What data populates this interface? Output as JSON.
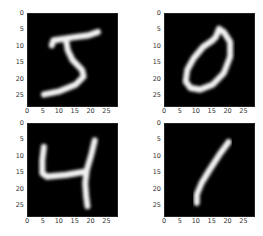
{
  "chart_data": [
    {
      "type": "heatmap",
      "title": "",
      "label": "5",
      "xlabel": "",
      "ylabel": "",
      "xlim": [
        0,
        28
      ],
      "ylim": [
        28,
        0
      ],
      "xticks": [
        "0",
        "5",
        "10",
        "15",
        "20",
        "25"
      ],
      "yticks": [
        "0",
        "5",
        "10",
        "15",
        "20",
        "25"
      ],
      "colormap": "gray",
      "grid": false,
      "stroke": "M22,5.5 L19,6.5 L15,7 L8,8 L7.5,9.5 M12,8 L12.5,11 L14,14 L17,17 L17.5,19 L15,21.5 L10,23.5 L5,24.5"
    },
    {
      "type": "heatmap",
      "title": "",
      "label": "0",
      "xlabel": "",
      "ylabel": "",
      "xlim": [
        0,
        28
      ],
      "ylim": [
        28,
        0
      ],
      "xticks": [
        "0",
        "5",
        "10",
        "15",
        "20",
        "25"
      ],
      "yticks": [
        "0",
        "5",
        "10",
        "15",
        "20",
        "25"
      ],
      "colormap": "gray",
      "grid": false,
      "stroke": "M15,8 L12,10 L9,13.5 L7,17 L6.5,20.5 L8,22.5 L11,23 L15,21.5 L18.5,18 L20.5,13 L20.5,8.5 L18.5,5.5 L17,4.5 L16,7 L15,8"
    },
    {
      "type": "heatmap",
      "title": "",
      "label": "4",
      "xlabel": "",
      "ylabel": "",
      "xlim": [
        0,
        28
      ],
      "ylim": [
        28,
        0
      ],
      "xticks": [
        "0",
        "5",
        "10",
        "15",
        "20",
        "25"
      ],
      "yticks": [
        "0",
        "5",
        "10",
        "15",
        "20",
        "25"
      ],
      "colormap": "gray",
      "grid": false,
      "stroke": "M5,7 L4.5,11 L4.5,15 L6,16 L12,15.5 L18,14.5 M21,5 L20,9 L18.5,14 L18,18 L18.3,22 L18.7,25"
    },
    {
      "type": "heatmap",
      "title": "",
      "label": "1",
      "xlabel": "",
      "ylabel": "",
      "xlim": [
        0,
        28
      ],
      "ylim": [
        28,
        0
      ],
      "xticks": [
        "0",
        "5",
        "10",
        "15",
        "20",
        "25"
      ],
      "yticks": [
        "0",
        "5",
        "10",
        "15",
        "20",
        "25"
      ],
      "colormap": "gray",
      "grid": false,
      "stroke": "M20,5.5 L17,9.5 L14,14 L11.5,18 L10,21.5 L10,24"
    }
  ]
}
